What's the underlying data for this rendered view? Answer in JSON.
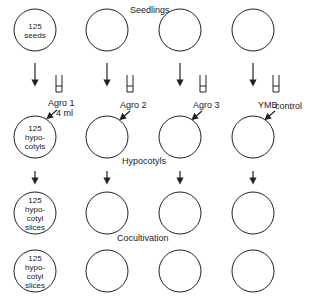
{
  "diagram": {
    "row_labels": {
      "seedlings": "Seedlings",
      "hypocotyls": "Hypocotyls",
      "cocultivation_line1": "Cocultivation",
      "cocultivation_line2": "plates"
    },
    "column_tubes": [
      {
        "label": "Agro  1",
        "volume": "4  ml"
      },
      {
        "label": "Agro  2"
      },
      {
        "label": "Agro  3"
      },
      {
        "label": "YMB",
        "extra": "control"
      }
    ],
    "circles": {
      "row1_col1": [
        "125",
        "seeds"
      ],
      "row2_col1": [
        "125",
        "hypo-",
        "cotyls"
      ],
      "row3_col1": [
        "125",
        "hypo-",
        "cotyl",
        "slices"
      ],
      "row4_col1": [
        "125",
        "hypo-",
        "cotyl",
        "slices"
      ]
    },
    "colors": {
      "stroke": "#222222",
      "background": "#ffffff"
    }
  }
}
